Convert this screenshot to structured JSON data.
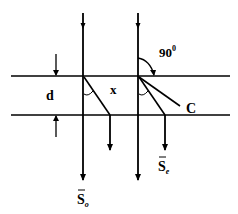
{
  "diagram": {
    "labels": {
      "thickness": "d",
      "displacement": "x",
      "angle": "90",
      "angle_sup": "0",
      "optic_axis": "C",
      "ordinary_ray": "S",
      "ordinary_sub": "o",
      "extraordinary_ray": "S",
      "extraordinary_sub": "e"
    },
    "colors": {
      "line": "#000000",
      "background": "#ffffff"
    }
  }
}
